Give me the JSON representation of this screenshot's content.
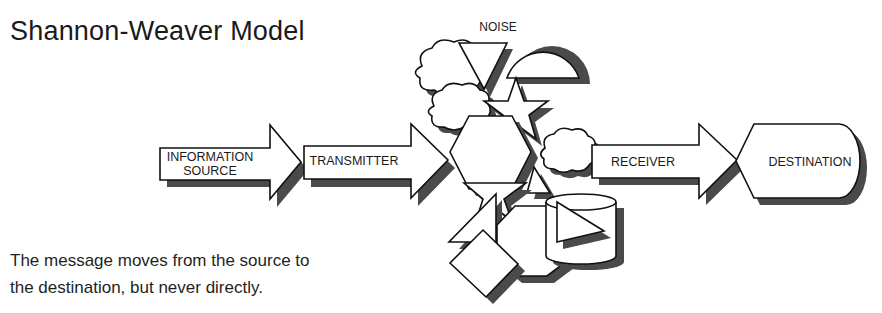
{
  "title": "Shannon-Weaver Model",
  "caption": {
    "line1": "The message moves from the source to",
    "line2": "the destination, but never directly."
  },
  "noise": {
    "label": "NOISE"
  },
  "flow": [
    {
      "id": "information-source",
      "line1": "INFORMATION",
      "line2": "SOURCE",
      "shape": "arrow"
    },
    {
      "id": "transmitter",
      "label": "TRANSMITTER",
      "shape": "arrow"
    },
    {
      "id": "receiver",
      "label": "RECEIVER",
      "shape": "arrow"
    },
    {
      "id": "destination",
      "label": "DESTINATION",
      "shape": "display"
    }
  ],
  "noise_shapes": [
    "cloud",
    "triangle",
    "half-circle",
    "cloud",
    "star",
    "hexagon",
    "cloud",
    "star",
    "triangle",
    "octagon",
    "cylinder",
    "triangle",
    "diamond"
  ],
  "colors": {
    "stroke": "#111111",
    "fill": "#ffffff",
    "shadow": "#4a4a4a",
    "text": "#1a1a1a"
  }
}
